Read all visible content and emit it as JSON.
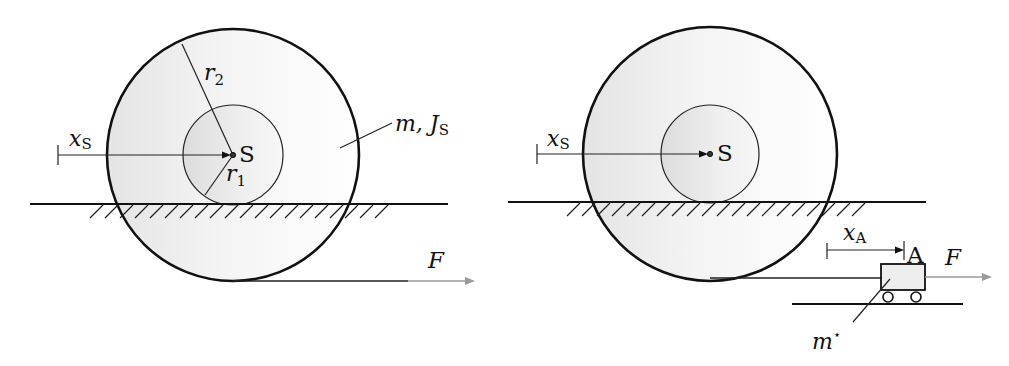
{
  "colors": {
    "line": "#111111",
    "fill_gradient_light": "#f6f6f6",
    "fill_gradient_dark": "#e2e2e2",
    "force_arrow": "#9a9a9a"
  },
  "left_diagram": {
    "center_label": "S",
    "outer_radius_label": "r",
    "outer_radius_sub": "2",
    "inner_radius_label": "r",
    "inner_radius_sub": "1",
    "position_label": "x",
    "position_sub": "S",
    "mass_label": "m, J",
    "mass_sub": "S",
    "force_label": "F"
  },
  "right_diagram": {
    "center_label": "S",
    "position_label": "x",
    "position_sub": "S",
    "cart_position_label": "x",
    "cart_position_sub": "A",
    "cart_point_label": "A",
    "force_label": "F",
    "cart_mass_label": "m",
    "cart_mass_sup": "⋆"
  }
}
